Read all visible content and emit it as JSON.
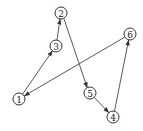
{
  "diagram": {
    "type": "directed-graph",
    "nodes": [
      {
        "id": "1",
        "label": "①",
        "x": 19,
        "y": 99
      },
      {
        "id": "2",
        "label": "②",
        "x": 61,
        "y": 13
      },
      {
        "id": "3",
        "label": "③",
        "x": 56,
        "y": 46
      },
      {
        "id": "4",
        "label": "④",
        "x": 113,
        "y": 117
      },
      {
        "id": "5",
        "label": "⑤",
        "x": 90,
        "y": 93
      },
      {
        "id": "6",
        "label": "⑥",
        "x": 130,
        "y": 34
      }
    ],
    "edges": [
      {
        "from": "1",
        "to": "3"
      },
      {
        "from": "3",
        "to": "2"
      },
      {
        "from": "2",
        "to": "5"
      },
      {
        "from": "5",
        "to": "4"
      },
      {
        "from": "4",
        "to": "6"
      },
      {
        "from": "6",
        "to": "1"
      }
    ],
    "labels": {
      "n1": "1",
      "n2": "2",
      "n3": "3",
      "n4": "4",
      "n5": "5",
      "n6": "6"
    }
  }
}
